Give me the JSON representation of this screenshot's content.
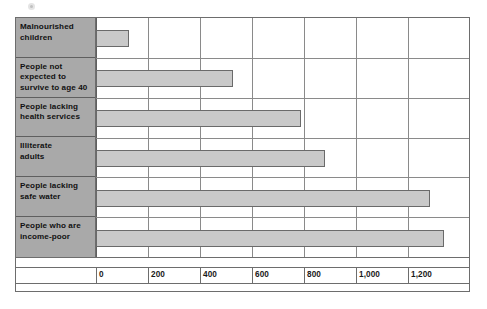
{
  "chart": {
    "title": "",
    "frame_border_color": "#6d6d6d",
    "label_panel_color": "#a9a9a9",
    "bar_fill_color": "#c9c9c9",
    "bar_border_color": "#6a6a6a",
    "gridline_color": "#8a8a8a"
  },
  "axis": {
    "tick_labels": [
      "0",
      "200",
      "400",
      "600",
      "800",
      "1,000",
      "1,200"
    ],
    "tick_values": [
      0,
      200,
      400,
      600,
      800,
      1000,
      1200
    ]
  },
  "categories": [
    {
      "line1": "Malnourished",
      "line2": "children",
      "line3": ""
    },
    {
      "line1": "People not",
      "line2": "expected to",
      "line3": "survive to age 40"
    },
    {
      "line1": "People lacking",
      "line2": "health services",
      "line3": ""
    },
    {
      "line1": "Illiterate",
      "line2": "adults",
      "line3": ""
    },
    {
      "line1": "People lacking",
      "line2": "safe water",
      "line3": ""
    },
    {
      "line1": "People who are",
      "line2": "income-poor",
      "line3": ""
    }
  ],
  "chart_data": {
    "type": "bar",
    "orientation": "horizontal",
    "title": "",
    "xlabel": "",
    "ylabel": "",
    "xlim": [
      0,
      1300
    ],
    "grid": true,
    "legend": false,
    "categories": [
      "Malnourished children",
      "People not expected to survive to age 40",
      "People lacking health services",
      "Illiterate adults",
      "People lacking safe water",
      "People who are income-poor"
    ],
    "values": [
      125,
      525,
      790,
      880,
      1285,
      1340
    ],
    "xticks": [
      0,
      200,
      400,
      600,
      800,
      1000,
      1200
    ],
    "xticklabels": [
      "0",
      "200",
      "400",
      "600",
      "800",
      "1,000",
      "1,200"
    ]
  }
}
